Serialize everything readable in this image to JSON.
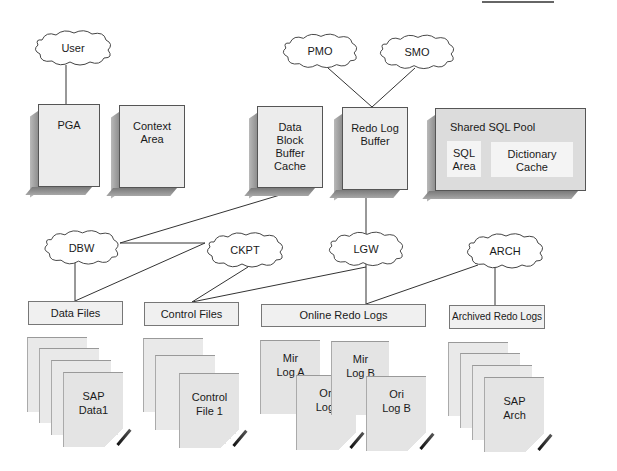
{
  "diagram": {
    "processes": {
      "user": "User",
      "pmo": "PMO",
      "smo": "SMO",
      "dbw": "DBW",
      "ckpt": "CKPT",
      "lgw": "LGW",
      "arch": "ARCH"
    },
    "memory": {
      "pga": "PGA",
      "context_area": [
        "Context",
        "Area"
      ],
      "data_block": [
        "Data",
        "Block",
        "Buffer",
        "Cache"
      ],
      "redo_buffer": [
        "Redo Log",
        "Buffer"
      ],
      "shared_pool": {
        "title": "Shared SQL Pool",
        "sql_area": [
          "SQL",
          "Area"
        ],
        "dictionary_cache": [
          "Dictionary",
          "Cache"
        ]
      }
    },
    "file_groups": {
      "data_files": "Data Files",
      "control_files": "Control Files",
      "online_redo": "Online Redo Logs",
      "archived_redo": "Archived Redo Logs"
    },
    "documents": {
      "sap_data": [
        "SAP",
        "Data1"
      ],
      "control_file": [
        "Control",
        "File 1"
      ],
      "mir_a": [
        "Mir",
        "Log A"
      ],
      "ori_a": [
        "Ori",
        "Log"
      ],
      "mir_b": [
        "Mir",
        "Log B"
      ],
      "ori_b": [
        "Ori",
        "Log B"
      ],
      "sap_arch": [
        "SAP",
        "Arch"
      ]
    }
  }
}
